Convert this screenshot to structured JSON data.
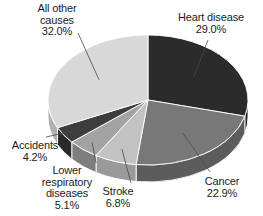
{
  "chart_data": {
    "type": "pie",
    "title": "",
    "subtitle": "",
    "xlabel": "",
    "ylabel": "",
    "legend_position": "none",
    "grid": false,
    "style": "3d-pie-grayscale",
    "start_angle_deg": 0,
    "direction": "clockwise",
    "categories": [
      "Heart disease",
      "Cancer",
      "Stroke",
      "Lower respiratory diseases",
      "Accidents",
      "All other causes"
    ],
    "values": [
      29.0,
      22.9,
      6.8,
      5.1,
      4.2,
      32.0
    ],
    "value_labels": [
      "29.0%",
      "22.9%",
      "6.8%",
      "5.1%",
      "4.2%",
      "32.0%"
    ],
    "slice_colors": [
      "#2b2b2b",
      "#787878",
      "#c2c2c2",
      "#a3a3a3",
      "#3d3d3d",
      "#d8d8d8"
    ],
    "slice_side_colors": [
      "#1a1a1a",
      "#5c5c5c",
      "#9a9a9a",
      "#7e7e7e",
      "#2a2a2a",
      "#b0b0b0"
    ],
    "slices": [
      {
        "name": "Heart disease",
        "value": 29.0,
        "label": "Heart disease",
        "value_label": "29.0%",
        "color": "#2b2b2b"
      },
      {
        "name": "Cancer",
        "value": 22.9,
        "label": "Cancer",
        "value_label": "22.9%",
        "color": "#787878"
      },
      {
        "name": "Stroke",
        "value": 6.8,
        "label": "Stroke",
        "value_label": "6.8%",
        "color": "#c2c2c2"
      },
      {
        "name": "Lower respiratory diseases",
        "value": 5.1,
        "label": "Lower\nrespiratory\ndiseases",
        "value_label": "5.1%",
        "color": "#a3a3a3"
      },
      {
        "name": "Accidents",
        "value": 4.2,
        "label": "Accidents",
        "value_label": "4.2%",
        "color": "#3d3d3d"
      },
      {
        "name": "All other causes",
        "value": 32.0,
        "label": "All other\ncauses",
        "value_label": "32.0%",
        "color": "#d8d8d8"
      }
    ]
  },
  "labels": {
    "all_other_causes": "All other\ncauses\n32.0%",
    "heart_disease": "Heart disease\n29.0%",
    "cancer": "Cancer\n22.9%",
    "stroke": "Stroke\n6.8%",
    "lower_respiratory": "Lower\nrespiratory\ndiseases\n5.1%",
    "accidents": "Accidents\n4.2%"
  },
  "colors": {
    "background": "#ffffff",
    "text": "#1b1b1b",
    "leader_line": "#4a4a4a",
    "slice_edge": "#ffffff"
  }
}
